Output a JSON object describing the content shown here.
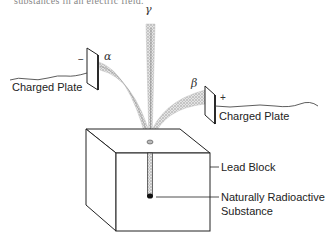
{
  "caption_partial": "substances in an electric field.",
  "rays": {
    "gamma": "γ",
    "alpha": "α",
    "beta": "β"
  },
  "plates": {
    "left": {
      "label": "Charged Plate",
      "sign": "−"
    },
    "right": {
      "label": "Charged Plate",
      "sign": "+"
    }
  },
  "labels": {
    "lead_block": "Lead Block",
    "substance_line1": "Naturally Radioactive",
    "substance_line2": "Substance"
  },
  "colors": {
    "line": "#222222",
    "beam": "#9a9a9a",
    "background": "#ffffff"
  }
}
